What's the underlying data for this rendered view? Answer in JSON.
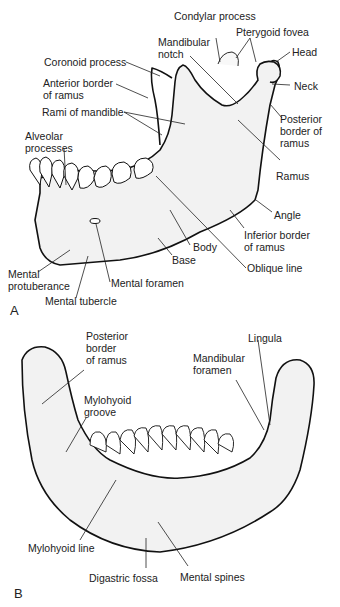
{
  "figure": {
    "panels": [
      {
        "id": "A",
        "label": "A",
        "view": "lateral",
        "labels": {
          "condylar_process": "Condylar process",
          "pterygoid_fovea": "Pterygoid fovea",
          "mandibular_notch": "Mandibular\nnotch",
          "head": "Head",
          "coronoid_process": "Coronoid process",
          "neck": "Neck",
          "anterior_border_of_ramus": "Anterior border\nof ramus",
          "posterior_border_of_ramus": "Posterior\nborder of\nramus",
          "rami_of_mandible": "Rami of mandible",
          "alveolar_processes": "Alveolar\nprocesses",
          "ramus": "Ramus",
          "angle": "Angle",
          "inferior_border_of_ramus": "Inferior border\nof ramus",
          "body": "Body",
          "base": "Base",
          "oblique_line": "Oblique line",
          "mental_protuberance": "Mental\nprotuberance",
          "mental_foramen": "Mental foramen",
          "mental_tubercle": "Mental tubercle"
        }
      },
      {
        "id": "B",
        "label": "B",
        "view": "posterior-superior",
        "labels": {
          "posterior_border_of_ramus": "Posterior\nborder\nof ramus",
          "lingula": "Lingula",
          "mandibular_foramen": "Mandibular\nforamen",
          "mylohyoid_groove": "Mylohyoid\ngroove",
          "mylohyoid_line": "Mylohyoid line",
          "digastric_fossa": "Digastric fossa",
          "mental_spines": "Mental spines"
        }
      }
    ]
  }
}
